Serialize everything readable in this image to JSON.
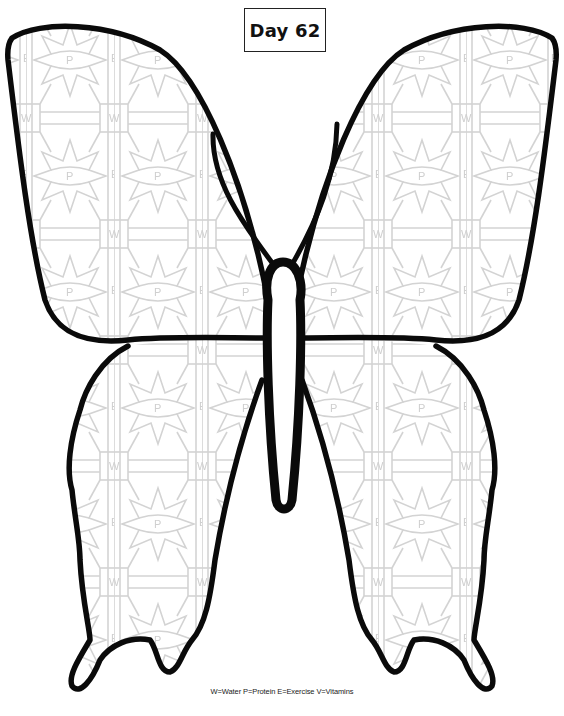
{
  "title": {
    "day_label": "Day 62"
  },
  "legend": {
    "text": "W=Water P=Protein E=Exercise V=Vitamins",
    "items": [
      {
        "letter": "W",
        "meaning": "Water"
      },
      {
        "letter": "P",
        "meaning": "Protein"
      },
      {
        "letter": "E",
        "meaning": "Exercise"
      },
      {
        "letter": "V",
        "meaning": "Vitamins"
      }
    ]
  },
  "pattern": {
    "star_letter": "P",
    "box_letter": "W",
    "side_letter_e": "E",
    "side_letter_v": "V",
    "line_color": "#d3d3d3",
    "outline_color": "#0a0a0a"
  },
  "illustration": {
    "subject": "butterfly",
    "parts": [
      "upper-left-wing",
      "upper-right-wing",
      "lower-left-wing",
      "lower-right-wing",
      "body",
      "antenna-left",
      "antenna-right"
    ]
  }
}
